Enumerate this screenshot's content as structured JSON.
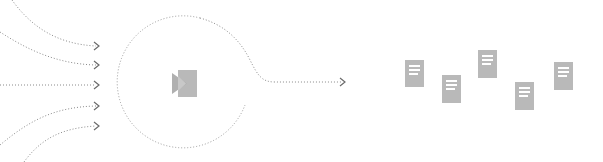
{
  "diagram": {
    "colors": {
      "line": "#8a8a8a",
      "arrowhead": "#6a6a6a",
      "ring": "#9a9a9a",
      "icon": "#b9b9b9",
      "background": "#ffffff"
    },
    "inputs": [
      {
        "id": "input-1",
        "tip_y": 46
      },
      {
        "id": "input-2",
        "tip_y": 65
      },
      {
        "id": "input-3",
        "tip_y": 85
      },
      {
        "id": "input-4",
        "tip_y": 106
      },
      {
        "id": "input-5",
        "tip_y": 126
      }
    ],
    "processor": {
      "shape": "dotted-circle",
      "icon": "import-icon"
    },
    "output": {
      "arrow": "output-arrow"
    },
    "documents": [
      {
        "id": "document-1",
        "x": 405,
        "y": 60
      },
      {
        "id": "document-2",
        "x": 442,
        "y": 75
      },
      {
        "id": "document-3",
        "x": 478,
        "y": 50
      },
      {
        "id": "document-4",
        "x": 515,
        "y": 82
      },
      {
        "id": "document-5",
        "x": 554,
        "y": 62
      }
    ]
  }
}
